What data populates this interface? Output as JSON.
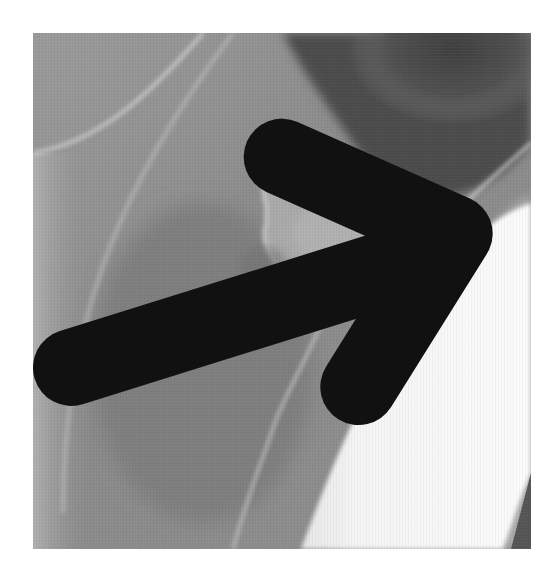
{
  "image": {
    "kind": "radiograph",
    "description": "Grayscale X-ray showing an irregular bony/calcified mass outlined against soft tissue, with a black arrow pointing to its lower-left margin",
    "panel": {
      "left": 33,
      "top": 33,
      "width": 498,
      "height": 516
    },
    "background_color": "#ffffff",
    "colors": {
      "soft_tissue": "#8e8e8e",
      "dark_region": "#4a4a4a",
      "bright_region": "#f4f4f4",
      "cortical_line": "#d6d6d6",
      "arrow": "#111111"
    },
    "annotations": [
      {
        "type": "arrow",
        "icon": "arrow-right-icon",
        "direction": "pointing right/up-right",
        "x": 226,
        "y": 256
      }
    ]
  }
}
